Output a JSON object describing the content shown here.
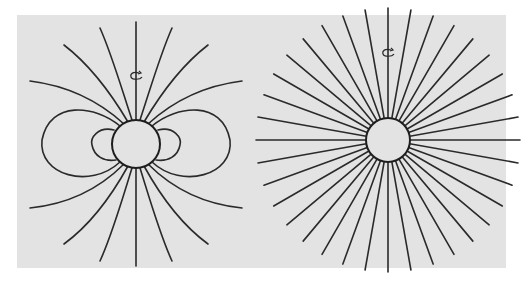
{
  "figure": {
    "background_color": "#e3e3e3",
    "line_color": "#2a2a2a",
    "panels": [
      {
        "id": "left",
        "label": "Dipole magnetic field",
        "description": "Sphere with dipolar field lines; open lines fan out from poles, closed loops on equatorial sides, rotation axis vertical with rotation arrow",
        "sphere": {
          "cx": 136,
          "cy": 144,
          "r": 24
        },
        "rotation_arrow": {
          "cx": 136,
          "cy": 76
        },
        "closed_loops_per_side": 2,
        "open_lines_per_hemisphere": 7
      },
      {
        "id": "right",
        "label": "Radial (monopole-like) field",
        "description": "Sphere with 36 straight radial field lines at 10 degree spacing, rotation arrow near top",
        "sphere": {
          "cx": 388,
          "cy": 140,
          "r": 22
        },
        "rotation_arrow": {
          "cx": 388,
          "cy": 53
        },
        "radial_line_count": 36,
        "radial_line_length": 110
      }
    ]
  }
}
